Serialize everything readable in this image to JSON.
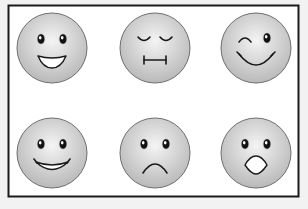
{
  "colors": {
    "background": "#f2f2f2",
    "frame_fill": "#ffffff",
    "frame_border": "#1a1a1a",
    "face_light": "#f4f4f4",
    "face_dark": "#b9b9b9",
    "face_outline": "#6e6e6e",
    "feature": "#1a1a1a"
  },
  "grid": {
    "rows": 2,
    "columns": 3
  },
  "faces": [
    {
      "name": "grinning",
      "eyes": "open",
      "mouth": "open-grin"
    },
    {
      "name": "sleepy",
      "eyes": "closed",
      "mouth": "flat-line"
    },
    {
      "name": "winking",
      "eyes": "wink-left",
      "mouth": "smile-curve"
    },
    {
      "name": "smiling",
      "eyes": "open",
      "mouth": "wide-smile"
    },
    {
      "name": "sad",
      "eyes": "open",
      "mouth": "frown"
    },
    {
      "name": "surprised",
      "eyes": "open",
      "mouth": "open-o"
    }
  ]
}
